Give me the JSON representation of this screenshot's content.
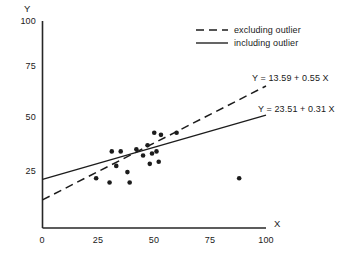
{
  "chart_data": {
    "type": "scatter",
    "title": "",
    "xlabel": "X",
    "ylabel": "Y",
    "xlim": [
      0,
      100
    ],
    "ylim": [
      0,
      100
    ],
    "xticks": [
      "0",
      "25",
      "50",
      "75",
      "100"
    ],
    "xtick_values": [
      0,
      25,
      50,
      75,
      100
    ],
    "yticks": [
      "25",
      "50",
      "75",
      "100"
    ],
    "ytick_values": [
      25,
      50,
      75,
      100
    ],
    "grid": false,
    "legend_position": "top-right",
    "points": [
      {
        "x": 24,
        "y": 24
      },
      {
        "x": 30,
        "y": 22
      },
      {
        "x": 31,
        "y": 37
      },
      {
        "x": 33,
        "y": 30
      },
      {
        "x": 35,
        "y": 37
      },
      {
        "x": 38,
        "y": 27
      },
      {
        "x": 39,
        "y": 22
      },
      {
        "x": 42,
        "y": 38
      },
      {
        "x": 45,
        "y": 35
      },
      {
        "x": 47,
        "y": 40
      },
      {
        "x": 48,
        "y": 31
      },
      {
        "x": 49,
        "y": 36
      },
      {
        "x": 50,
        "y": 46
      },
      {
        "x": 51,
        "y": 37
      },
      {
        "x": 52,
        "y": 32
      },
      {
        "x": 53,
        "y": 45
      },
      {
        "x": 60,
        "y": 46
      },
      {
        "x": 88,
        "y": 24
      }
    ],
    "series": [
      {
        "name": "excluding outlier",
        "style": "dashed",
        "intercept": 13.59,
        "slope": 0.55,
        "equation": "Y = 13.59 + 0.55 X",
        "x_start": 0,
        "x_end": 100
      },
      {
        "name": "including outlier",
        "style": "solid",
        "intercept": 23.51,
        "slope": 0.31,
        "equation": "Y = 23.51 + 0.31 X",
        "x_start": 0,
        "x_end": 100
      }
    ],
    "legend": [
      {
        "label": "excluding outlier",
        "style": "dashed"
      },
      {
        "label": "including outlier",
        "style": "solid"
      }
    ],
    "annotations": [
      {
        "text": "Y = 13.59 + 0.55 X",
        "for": "excluding outlier"
      },
      {
        "text": "Y = 23.51 + 0.31 X",
        "for": "including outlier"
      }
    ]
  }
}
